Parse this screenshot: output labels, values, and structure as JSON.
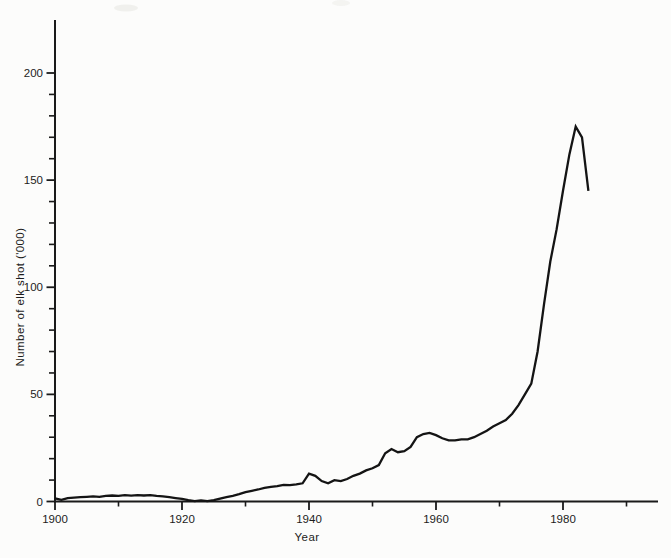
{
  "figure": {
    "background_color": "#fcfcfb",
    "axis_color": "#1a1a1a",
    "line_color": "#141414",
    "text_color": "#1c1c1c"
  },
  "chart_data": {
    "type": "line",
    "title": "",
    "xlabel": "Year",
    "ylabel": "Number of elk shot ('000)",
    "xlim": [
      1900,
      1995
    ],
    "ylim": [
      0,
      225
    ],
    "grid": false,
    "legend": false,
    "x_ticks_major": [
      1900,
      1920,
      1940,
      1960,
      1980
    ],
    "x_ticks_minor": [
      1910,
      1930,
      1950,
      1970,
      1990
    ],
    "y_ticks_major": [
      0,
      50,
      100,
      150,
      200
    ],
    "y_minor_step": 10,
    "y_minor_max": 200,
    "series": [
      {
        "name": "elk-shot-thousands",
        "x": [
          1900,
          1901,
          1902,
          1903,
          1904,
          1905,
          1906,
          1907,
          1908,
          1909,
          1910,
          1911,
          1912,
          1913,
          1914,
          1915,
          1916,
          1917,
          1918,
          1919,
          1920,
          1921,
          1922,
          1923,
          1924,
          1925,
          1926,
          1927,
          1928,
          1929,
          1930,
          1931,
          1932,
          1933,
          1934,
          1935,
          1936,
          1937,
          1938,
          1939,
          1940,
          1941,
          1942,
          1943,
          1944,
          1945,
          1946,
          1947,
          1948,
          1949,
          1950,
          1951,
          1952,
          1953,
          1954,
          1955,
          1956,
          1957,
          1958,
          1959,
          1960,
          1961,
          1962,
          1963,
          1964,
          1965,
          1966,
          1967,
          1968,
          1969,
          1970,
          1971,
          1972,
          1973,
          1974,
          1975,
          1976,
          1977,
          1978,
          1979,
          1980,
          1981,
          1982,
          1983,
          1984
        ],
        "y": [
          1.5,
          0.8,
          1.6,
          1.8,
          2.0,
          2.2,
          2.4,
          2.2,
          2.6,
          2.8,
          2.6,
          3.0,
          2.7,
          3.0,
          2.8,
          3.0,
          2.6,
          2.4,
          2.0,
          1.6,
          1.2,
          0.6,
          0.2,
          0.5,
          0.2,
          0.6,
          1.3,
          2.0,
          2.6,
          3.4,
          4.4,
          5.0,
          5.6,
          6.4,
          6.8,
          7.2,
          7.8,
          7.6,
          8.0,
          8.5,
          13.0,
          12.0,
          9.5,
          8.5,
          10.0,
          9.5,
          10.5,
          12.0,
          13.0,
          14.5,
          15.5,
          17.0,
          22.5,
          24.5,
          23.0,
          23.5,
          25.5,
          30.0,
          31.5,
          32.0,
          31.0,
          29.5,
          28.5,
          28.5,
          29.0,
          29.0,
          30.0,
          31.5,
          33.0,
          35.0,
          36.5,
          38.0,
          41.0,
          45.0,
          50.0,
          55.0,
          70.0,
          92.0,
          112.0,
          127.0,
          145.0,
          162.0,
          175.0,
          170.0,
          145.0
        ]
      }
    ]
  }
}
